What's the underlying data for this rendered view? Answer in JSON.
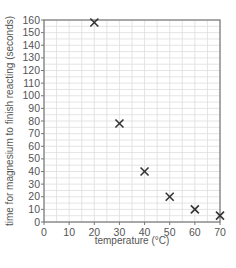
{
  "chart_data": {
    "type": "scatter",
    "title": "",
    "xlabel": "temperature (°C)",
    "ylabel": "time for magnesium to finish reacting (seconds)",
    "xlim": [
      0,
      70
    ],
    "ylim": [
      0,
      160
    ],
    "xticks": [
      0,
      10,
      20,
      30,
      40,
      50,
      60,
      70
    ],
    "yticks": [
      0,
      10,
      20,
      30,
      40,
      50,
      60,
      70,
      80,
      90,
      100,
      110,
      120,
      130,
      140,
      150,
      160
    ],
    "grid": true,
    "marker": "x",
    "legend": null,
    "points": [
      {
        "x": 20,
        "y": 158
      },
      {
        "x": 30,
        "y": 78
      },
      {
        "x": 40,
        "y": 40
      },
      {
        "x": 50,
        "y": 20
      },
      {
        "x": 60,
        "y": 10
      },
      {
        "x": 70,
        "y": 5
      }
    ]
  },
  "colors": {
    "axis": "#777777",
    "grid": "#dddddd",
    "marker": "#333333",
    "text": "#555555"
  }
}
